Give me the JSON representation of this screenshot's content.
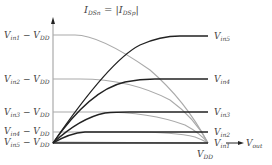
{
  "diagram": {
    "title": {
      "main": "I",
      "sub1": "DSn",
      "eq": " = |I",
      "sub2": "DSp",
      "close": "|"
    },
    "x_axis_label": {
      "main": "V",
      "sub": "out"
    },
    "x_end_label": {
      "main": "V",
      "sub": "DD"
    },
    "left_labels": [
      {
        "main": "V",
        "sub": "in1",
        "tail": " − V",
        "tsub": "DD"
      },
      {
        "main": "V",
        "sub": "in2",
        "tail": " − V",
        "tsub": "DD"
      },
      {
        "main": "V",
        "sub": "in3",
        "tail": " − V",
        "tsub": "DD"
      },
      {
        "main": "V",
        "sub": "in4",
        "tail": " − V",
        "tsub": "DD"
      },
      {
        "main": "V",
        "sub": "in5",
        "tail": " − V",
        "tsub": "DD"
      }
    ],
    "right_labels": [
      {
        "main": "V",
        "sub": "in5"
      },
      {
        "main": "V",
        "sub": "in4"
      },
      {
        "main": "V",
        "sub": "in3"
      },
      {
        "main": "V",
        "sub": "in2"
      },
      {
        "main": "V",
        "sub": "in1"
      }
    ],
    "colors": {
      "nmos_curve": "#222222",
      "pmos_curve": "#aaaaaa",
      "axis": "#999999",
      "text": "#444444"
    }
  }
}
